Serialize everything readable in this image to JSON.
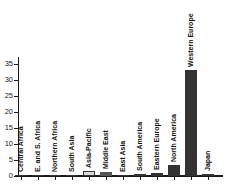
{
  "colors": {
    "background": "#ffffff",
    "axis": "#1a1a1a",
    "text": "#111111",
    "tick_text": "#222222",
    "bar_dark": "#333333",
    "bar_medium": "#555555",
    "bar_light": "#d9d9d9"
  },
  "chart_data": {
    "type": "bar",
    "title": "",
    "xlabel": "",
    "ylabel": "",
    "ylim": [
      0,
      35
    ],
    "yticks": [
      0,
      5,
      10,
      15,
      20,
      25,
      30,
      35
    ],
    "grid": false,
    "legend_position": "none",
    "bar_label_orientation": "vertical-bottom-to-top",
    "categories": [
      "Central Africa",
      "E. and S. Africa",
      "Northern Africa",
      "South Asia",
      "Asia-Pacific",
      "Middle East",
      "East Asia",
      "South America",
      "Eastern Europe",
      "North America",
      "Western Europe",
      "Japan"
    ],
    "values": [
      0.1,
      0.1,
      0.2,
      0.3,
      1.7,
      1.3,
      0.3,
      0.6,
      0.8,
      3.4,
      33,
      0.5
    ],
    "bar_fills": [
      "#333333",
      "#333333",
      "#333333",
      "#333333",
      "#d9d9d9",
      "#555555",
      "#333333",
      "#333333",
      "#333333",
      "#333333",
      "#333333",
      "#333333"
    ],
    "bar_borders": [
      "#333333",
      "#333333",
      "#333333",
      "#333333",
      "#333333",
      "#555555",
      "#333333",
      "#333333",
      "#333333",
      "#333333",
      "#333333",
      "#333333"
    ]
  }
}
